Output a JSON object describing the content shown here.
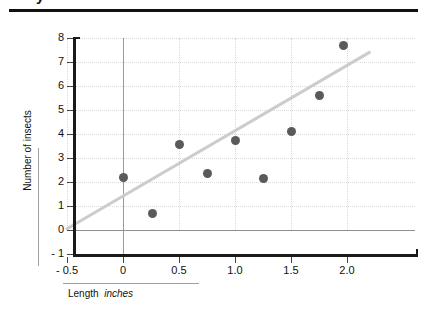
{
  "header": {
    "cropped_title": "y",
    "rule_color": "#111111"
  },
  "chart_data": {
    "type": "scatter",
    "title": "",
    "xlabel_main": "Length",
    "xlabel_unit": "inches",
    "ylabel": "Number of insects",
    "xlim": [
      -0.5,
      2.2
    ],
    "ylim": [
      -1,
      8
    ],
    "grid": true,
    "legend": "none",
    "x_ticks": [
      -0.5,
      0,
      0.5,
      1.0,
      1.5,
      2.0
    ],
    "x_tick_labels": [
      "- 0.5",
      "0",
      "0.5",
      "1.0",
      "1.5",
      "2.0"
    ],
    "y_ticks": [
      -1,
      0,
      1,
      2,
      3,
      4,
      5,
      6,
      7,
      8
    ],
    "y_tick_labels": [
      "- 1",
      "0",
      "1",
      "2",
      "3",
      "4",
      "5",
      "6",
      "7",
      "8"
    ],
    "marker_color": "#5a5a5a",
    "trend_color": "#cccccc",
    "points": [
      {
        "x": 0.0,
        "y": 2.2
      },
      {
        "x": 0.26,
        "y": 0.7
      },
      {
        "x": 0.5,
        "y": 3.55
      },
      {
        "x": 0.75,
        "y": 2.35
      },
      {
        "x": 1.0,
        "y": 3.75
      },
      {
        "x": 1.25,
        "y": 2.15
      },
      {
        "x": 1.5,
        "y": 4.1
      },
      {
        "x": 1.75,
        "y": 5.6
      },
      {
        "x": 1.97,
        "y": 7.7
      }
    ],
    "trend_line": {
      "x1": -0.5,
      "y1": 0.05,
      "x2": 2.2,
      "y2": 7.4
    }
  }
}
